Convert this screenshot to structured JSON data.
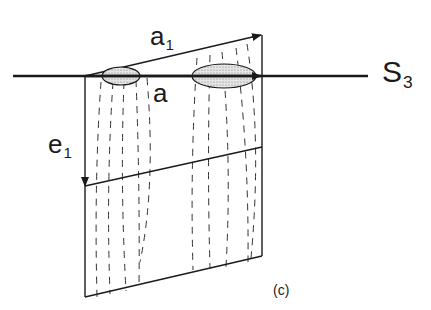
{
  "figure": {
    "panel_label": "(c)",
    "vectors": [
      {
        "id": "a1",
        "main": "a",
        "sub": "1"
      },
      {
        "id": "a",
        "main": "a",
        "sub": ""
      },
      {
        "id": "e1",
        "main": "e",
        "sub": "1"
      }
    ],
    "axis": {
      "main": "S",
      "sub": "3"
    }
  },
  "colors": {
    "stroke": "#1a1a1a",
    "fill_stipple": "#cfcfcf",
    "background": "#ffffff"
  }
}
